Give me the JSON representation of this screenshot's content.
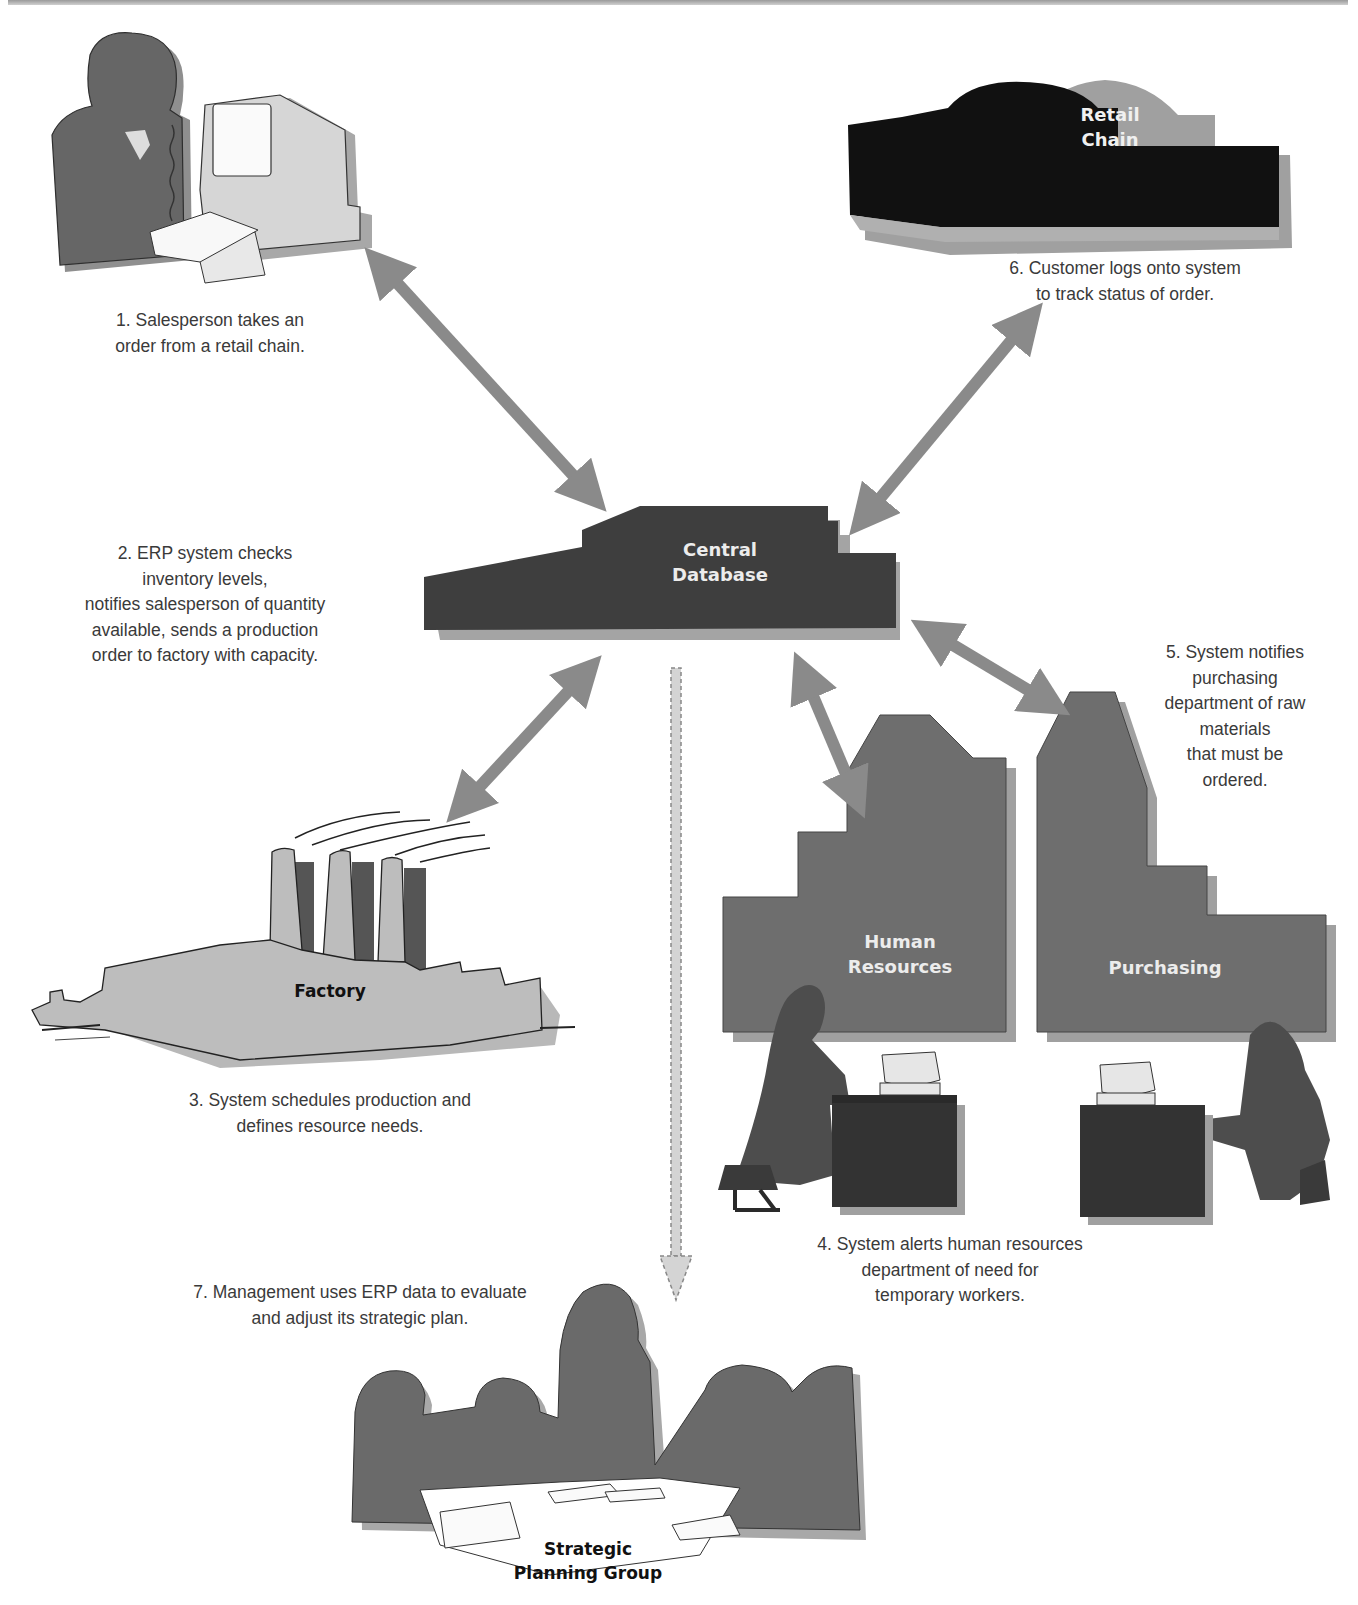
{
  "diagram": {
    "colors": {
      "arrow": "#8a8a8a",
      "central_db": "#3e3e3e",
      "retail_chain": "#111111",
      "departments": "#6e6e6e",
      "factory": "#bdbdbd",
      "people": "#6a6a6a",
      "shadow": "#a8a8a8"
    },
    "nodes": {
      "central_database": {
        "label": "Central\nDatabase"
      },
      "retail_chain": {
        "label": "Retail\nChain"
      },
      "factory": {
        "label": "Factory"
      },
      "human_resources": {
        "label": "Human\nResources"
      },
      "purchasing": {
        "label": "Purchasing"
      },
      "strategic_planning": {
        "label": "Strategic\nPlanning Group"
      }
    },
    "steps": [
      {
        "number": 1,
        "text": "1. Salesperson takes an\norder from a retail chain."
      },
      {
        "number": 2,
        "text": "2. ERP system checks\ninventory levels,\nnotifies salesperson of quantity\navailable, sends a production\norder to factory with capacity."
      },
      {
        "number": 3,
        "text": "3. System schedules production and\ndefines resource needs."
      },
      {
        "number": 4,
        "text": "4. System alerts human resources\ndepartment of need for\ntemporary workers."
      },
      {
        "number": 5,
        "text": "5. System notifies\npurchasing\ndepartment of raw\nmaterials\nthat must be\nordered."
      },
      {
        "number": 6,
        "text": "6. Customer logs onto system\nto track status of order."
      },
      {
        "number": 7,
        "text": "7. Management uses ERP data to evaluate\nand adjust its strategic plan."
      }
    ],
    "connections": [
      {
        "from": "salesperson",
        "to": "central_database",
        "type": "bidirectional"
      },
      {
        "from": "retail_chain",
        "to": "central_database",
        "type": "bidirectional"
      },
      {
        "from": "factory",
        "to": "central_database",
        "type": "bidirectional"
      },
      {
        "from": "human_resources",
        "to": "central_database",
        "type": "bidirectional"
      },
      {
        "from": "purchasing",
        "to": "central_database",
        "type": "bidirectional"
      },
      {
        "from": "central_database",
        "to": "strategic_planning",
        "type": "dashed-one-way"
      }
    ]
  }
}
